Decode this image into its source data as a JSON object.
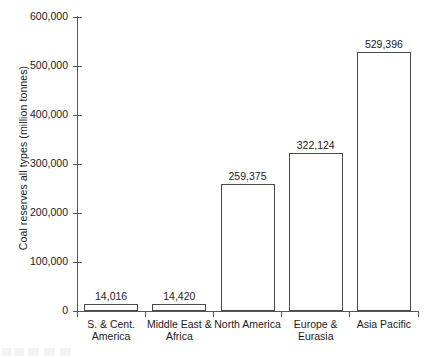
{
  "chart_data": {
    "type": "bar",
    "title": "",
    "xlabel": "",
    "ylabel": "Coal reserves all types (million tonnes)",
    "categories": [
      "S. & Cent. America",
      "Middle East & Africa",
      "North America",
      "Europe & Eurasia",
      "Asia Pacific"
    ],
    "category_lines": [
      [
        "S. & Cent.",
        "America"
      ],
      [
        "Middle East &",
        "Africa"
      ],
      [
        "North America",
        ""
      ],
      [
        "Europe &",
        "Eurasia"
      ],
      [
        "Asia Pacific",
        ""
      ]
    ],
    "values": [
      14016,
      14420,
      259375,
      322124,
      529396
    ],
    "value_labels": [
      "14,016",
      "14,420",
      "259,375",
      "322,124",
      "529,396"
    ],
    "ylim": [
      0,
      600000
    ],
    "ytick_values": [
      0,
      100000,
      200000,
      300000,
      400000,
      500000,
      600000
    ],
    "ytick_labels": [
      "0",
      "100,000",
      "200,000",
      "300,000",
      "400,000",
      "500,000",
      "600,000"
    ],
    "grid": false,
    "legend": false,
    "bar_fill_color": "#ffffff",
    "bar_edge_color": "#4a4a4a",
    "axis_color": "#555555",
    "background_color": "#ffffff"
  }
}
